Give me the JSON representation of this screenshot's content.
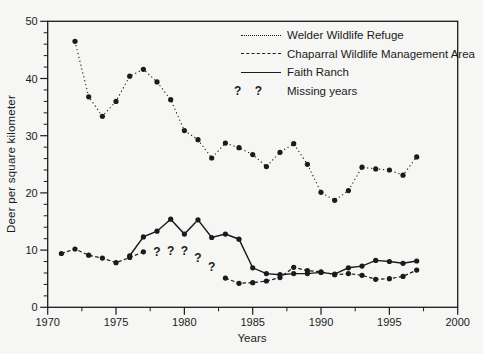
{
  "figure": {
    "background": "#f6f6f4",
    "ink_color": "#1b1b1b"
  },
  "legend": {
    "missing_symbol": "? ?",
    "missing_label": "Missing years"
  },
  "chart_data": {
    "type": "line",
    "title": "",
    "xlabel": "Years",
    "ylabel": "Deer per square kilometer",
    "xlim": [
      1970,
      2000
    ],
    "ylim": [
      0,
      50
    ],
    "xticks_major": [
      1970,
      1975,
      1980,
      1985,
      1990,
      1995,
      2000
    ],
    "xticks_minor": [
      1972.5,
      1977.5,
      1982.5,
      1987.5,
      1992.5,
      1997.5
    ],
    "yticks_major": [
      0,
      10,
      20,
      30,
      40,
      50
    ],
    "yticks_minor_step": 2,
    "grid": false,
    "legend_position": "top-center-inside",
    "frame": "full-box",
    "series": [
      {
        "name": "Welder Wildlife Refuge",
        "style": "dotted",
        "years": [
          1972,
          1973,
          1974,
          1975,
          1976,
          1977,
          1978,
          1979,
          1980,
          1981,
          1982,
          1983,
          1984,
          1985,
          1986,
          1987,
          1988,
          1989,
          1990,
          1991,
          1992,
          1993,
          1994,
          1995,
          1996,
          1997
        ],
        "values": [
          46.5,
          36.8,
          33.4,
          36.0,
          40.4,
          41.6,
          39.4,
          36.3,
          30.9,
          29.3,
          26.1,
          28.7,
          27.9,
          26.7,
          24.6,
          27.1,
          28.6,
          25.0,
          20.1,
          18.7,
          20.4,
          24.5,
          24.2,
          24.0,
          23.1,
          26.3
        ]
      },
      {
        "name": "Chaparral Wildlife Management Area",
        "style": "dashed",
        "years": [
          1971,
          1972,
          1973,
          1974,
          1975,
          1976,
          1977,
          1978,
          1979,
          1980,
          1981,
          1982,
          1983,
          1984,
          1985,
          1986,
          1987,
          1988,
          1989,
          1990,
          1991,
          1992,
          1993,
          1994,
          1995,
          1996,
          1997
        ],
        "values": [
          9.4,
          10.2,
          9.1,
          8.6,
          7.8,
          8.7,
          9.7,
          null,
          null,
          null,
          null,
          null,
          5.1,
          4.2,
          4.3,
          4.6,
          5.2,
          7.0,
          6.4,
          6.2,
          5.7,
          5.9,
          5.6,
          4.9,
          5.0,
          5.4,
          6.5
        ]
      },
      {
        "name": "Faith Ranch",
        "style": "solid",
        "years": [
          1976,
          1977,
          1978,
          1979,
          1980,
          1981,
          1982,
          1983,
          1984,
          1985,
          1986,
          1987,
          1988,
          1989,
          1990,
          1991,
          1992,
          1993,
          1994,
          1995,
          1996,
          1997
        ],
        "values": [
          9.0,
          12.3,
          13.3,
          15.4,
          12.8,
          15.3,
          12.2,
          12.8,
          11.9,
          6.9,
          5.9,
          5.7,
          5.9,
          5.9,
          6.1,
          5.8,
          6.9,
          7.2,
          8.2,
          8.0,
          7.7,
          8.1
        ]
      }
    ],
    "missing_marks": {
      "symbol": "?",
      "points": [
        {
          "year": 1978,
          "value": 9.7
        },
        {
          "year": 1979,
          "value": 9.8
        },
        {
          "year": 1980,
          "value": 9.8
        },
        {
          "year": 1981,
          "value": 8.7
        },
        {
          "year": 1982,
          "value": 7.0
        }
      ]
    }
  }
}
